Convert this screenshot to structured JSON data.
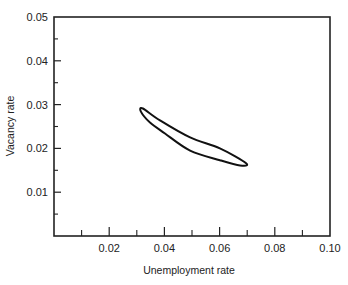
{
  "chart_data": {
    "type": "line",
    "title": "",
    "xlabel": "Unemployment rate",
    "ylabel": "Vacancy rate",
    "xlim": [
      0,
      0.1
    ],
    "ylim": [
      0,
      0.05
    ],
    "x_ticks": [
      0.02,
      0.04,
      0.06,
      0.08,
      0.1
    ],
    "x_tick_labels": [
      "0.02",
      "0.04",
      "0.06",
      "0.08",
      "0.10"
    ],
    "x_minor_ticks": [
      0.01,
      0.03,
      0.05,
      0.07,
      0.09
    ],
    "y_ticks": [
      0.01,
      0.02,
      0.03,
      0.04,
      0.05
    ],
    "y_tick_labels": [
      "0.01",
      "0.02",
      "0.03",
      "0.04",
      "0.05"
    ],
    "y_minor_ticks": [
      0.005,
      0.015,
      0.025,
      0.035,
      0.045
    ],
    "grid": false,
    "legend": null,
    "series": [
      {
        "name": "Beveridge loop",
        "closed": true,
        "x": [
          0.0315,
          0.0322,
          0.0384,
          0.0493,
          0.0601,
          0.0696,
          0.0674,
          0.0601,
          0.0493,
          0.0402,
          0.0348
        ],
        "y": [
          0.0284,
          0.0291,
          0.0264,
          0.0225,
          0.02,
          0.0166,
          0.0161,
          0.0173,
          0.0195,
          0.0234,
          0.0259
        ]
      }
    ]
  },
  "style": {
    "line_color": "#111111",
    "axis_color": "#222222",
    "background": "#ffffff"
  }
}
